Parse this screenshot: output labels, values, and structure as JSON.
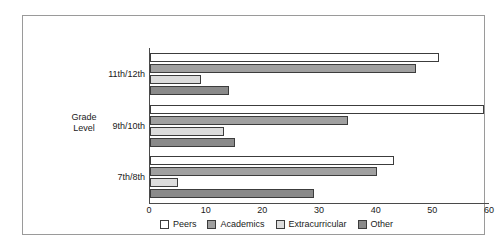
{
  "chart_data": {
    "type": "bar",
    "orientation": "horizontal",
    "title": "",
    "xlabel": "",
    "ylabel": "Grade\nLevel",
    "categories": [
      "11th/12th",
      "9th/10th",
      "7th/8th"
    ],
    "series": [
      {
        "name": "Peers",
        "color": "#ffffff",
        "values": [
          51,
          59,
          43
        ]
      },
      {
        "name": "Academics",
        "color": "#a0a0a0",
        "values": [
          47,
          35,
          40
        ]
      },
      {
        "name": "Extracurricular",
        "color": "#dcdcdc",
        "values": [
          9,
          13,
          5
        ]
      },
      {
        "name": "Other",
        "color": "#8a8a8a",
        "values": [
          14,
          15,
          29
        ]
      }
    ],
    "xlim": [
      0,
      60
    ],
    "xticks": [
      0,
      10,
      20,
      30,
      40,
      50,
      60
    ],
    "xtick_labels": [
      "0",
      "10",
      "20",
      "30",
      "40",
      "50",
      "60"
    ],
    "grid": false,
    "legend_position": "bottom"
  },
  "axis": {
    "y_title": "Grade\nLevel"
  },
  "legend": {
    "items": [
      {
        "label": "Peers"
      },
      {
        "label": "Academics"
      },
      {
        "label": "Extracurricular"
      },
      {
        "label": "Other"
      }
    ]
  }
}
